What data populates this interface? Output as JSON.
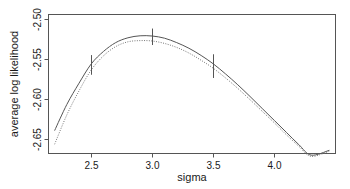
{
  "chart_data": {
    "type": "line",
    "title": "",
    "xlabel": "sigma",
    "ylabel": "average log likelihood",
    "xlim": [
      2.15,
      4.5
    ],
    "ylim": [
      -2.668,
      -2.495
    ],
    "xticks": [
      2.5,
      3.0,
      3.5,
      4.0
    ],
    "xticklabels": [
      "2.5",
      "3.0",
      "3.5",
      "4.0"
    ],
    "yticks": [
      -2.5,
      -2.55,
      -2.6,
      -2.65
    ],
    "yticklabels": [
      "-2.50",
      "-2.55",
      "-2.60",
      "-2.65"
    ],
    "grid": false,
    "legend": null,
    "frame": true,
    "series": [
      {
        "name": "solid-curve",
        "linestyle": "solid",
        "color": "#555555",
        "x": [
          2.2,
          2.3,
          2.4,
          2.5,
          2.6,
          2.7,
          2.8,
          2.9,
          3.0,
          3.1,
          3.2,
          3.3,
          3.4,
          3.5,
          3.6,
          3.7,
          3.8,
          3.9,
          4.0,
          4.1,
          4.2,
          4.3,
          4.45
        ],
        "y": [
          -2.6395,
          -2.607,
          -2.5805,
          -2.5565,
          -2.541,
          -2.53,
          -2.524,
          -2.5215,
          -2.5218,
          -2.5245,
          -2.53,
          -2.537,
          -2.546,
          -2.5565,
          -2.569,
          -2.5825,
          -2.597,
          -2.612,
          -2.627,
          -2.642,
          -2.657,
          -2.67,
          -2.664
        ]
      },
      {
        "name": "dotted-curve",
        "linestyle": "dotted",
        "color": "#777777",
        "x": [
          2.2,
          2.3,
          2.4,
          2.5,
          2.6,
          2.7,
          2.8,
          2.9,
          3.0,
          3.1,
          3.2,
          3.3,
          3.4,
          3.5,
          3.6,
          3.7,
          3.8,
          3.9,
          4.0,
          4.1,
          4.2,
          4.3,
          4.45
        ],
        "y": [
          -2.6565,
          -2.62,
          -2.59,
          -2.564,
          -2.5465,
          -2.535,
          -2.529,
          -2.5275,
          -2.528,
          -2.531,
          -2.536,
          -2.543,
          -2.552,
          -2.562,
          -2.574,
          -2.587,
          -2.601,
          -2.6155,
          -2.63,
          -2.645,
          -2.659,
          -2.6715,
          -2.665
        ]
      }
    ],
    "errorbars": [
      {
        "x": 2.5,
        "ylow": -2.57,
        "yhigh": -2.5455
      },
      {
        "x": 3.0,
        "ylow": -2.533,
        "yhigh": -2.5125
      },
      {
        "x": 3.5,
        "ylow": -2.574,
        "yhigh": -2.5445
      }
    ],
    "errorbar_color": "#555555"
  }
}
